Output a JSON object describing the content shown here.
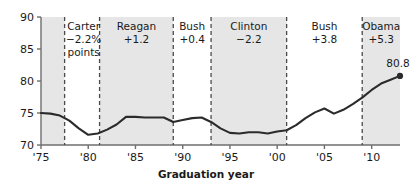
{
  "chart_data": {
    "type": "line",
    "title": "",
    "xlabel": "Graduation year",
    "ylabel": "",
    "ylim": [
      70,
      90
    ],
    "xlim": [
      1975,
      2013
    ],
    "grid": false,
    "legend": "none",
    "y_ticks": [
      "70",
      "75",
      "80",
      "85",
      "90"
    ],
    "y_tick_values": [
      70,
      75,
      80,
      85,
      90
    ],
    "x_ticks": [
      "'75",
      "'80",
      "'85",
      "'90",
      "'95",
      "'00",
      "'05",
      "'10"
    ],
    "x_tick_values": [
      1975,
      1980,
      1985,
      1990,
      1995,
      2000,
      2005,
      2010
    ],
    "x": [
      1975,
      1976,
      1977,
      1978,
      1979,
      1980,
      1981,
      1982,
      1983,
      1984,
      1985,
      1986,
      1987,
      1988,
      1989,
      1990,
      1991,
      1992,
      1993,
      1994,
      1995,
      1996,
      1997,
      1998,
      1999,
      2000,
      2001,
      2002,
      2003,
      2004,
      2005,
      2006,
      2007,
      2008,
      2009,
      2010,
      2011,
      2012,
      2013
    ],
    "values": [
      75.0,
      74.9,
      74.6,
      73.8,
      72.6,
      71.6,
      71.8,
      72.4,
      73.2,
      74.4,
      74.4,
      74.3,
      74.3,
      74.3,
      73.6,
      73.9,
      74.2,
      74.3,
      73.6,
      72.6,
      71.9,
      71.8,
      72.0,
      72.0,
      71.8,
      72.1,
      72.3,
      73.1,
      74.2,
      75.1,
      75.7,
      74.9,
      75.5,
      76.4,
      77.4,
      78.6,
      79.6,
      80.2,
      80.8
    ],
    "endpoint": {
      "x": 2013,
      "y": 80.8,
      "label": "80.8"
    },
    "annotations": [
      {
        "id": "carter",
        "name": "Carter",
        "value": "−2.2%",
        "extra": "points",
        "start": 1977.5,
        "end": 1981.2,
        "shaded": false
      },
      {
        "id": "reagan",
        "name": "Reagan",
        "value": "+1.2",
        "extra": "",
        "start": 1981.2,
        "end": 1989.0,
        "shaded": true
      },
      {
        "id": "bush-41",
        "name": "Bush",
        "value": "+0.4",
        "extra": "",
        "start": 1989.0,
        "end": 1993.0,
        "shaded": false
      },
      {
        "id": "clinton",
        "name": "Clinton",
        "value": "−2.2",
        "extra": "",
        "start": 1993.0,
        "end": 2001.0,
        "shaded": true
      },
      {
        "id": "bush-43",
        "name": "Bush",
        "value": "+3.8",
        "extra": "",
        "start": 2001.0,
        "end": 2009.0,
        "shaded": false
      },
      {
        "id": "obama",
        "name": "Obama",
        "value": "+5.3",
        "extra": "",
        "start": 2009.0,
        "end": 2013.6,
        "shaded": true
      }
    ],
    "pre_era_shaded": {
      "start": 1975,
      "end": 1977.5
    },
    "colors": {
      "line": "#2b2b2b",
      "band": "#e6e6e6",
      "axis": "#6e6e6e",
      "divider": "#4a4a4a",
      "text": "#1a1a1a",
      "background": "#ffffff"
    }
  }
}
